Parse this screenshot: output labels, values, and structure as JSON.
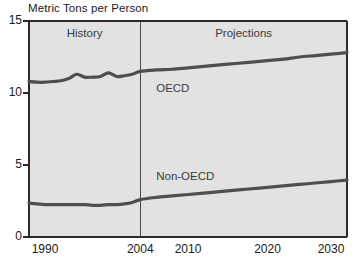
{
  "chart_data": {
    "type": "line",
    "title": "Metric Tons per Person",
    "xlabel": "",
    "ylabel": "Metric Tons per Person",
    "xlim": [
      1990,
      2030
    ],
    "ylim": [
      0,
      15
    ],
    "grid": false,
    "legend_position": "inline-annotation",
    "xticks": [
      "1990",
      "2004",
      "2010",
      "2020",
      "2030"
    ],
    "xtick_values": [
      1990,
      2004,
      2010,
      2020,
      2030
    ],
    "yticks": [
      "0",
      "5",
      "10",
      "15"
    ],
    "ytick_values": [
      0,
      5,
      10,
      15
    ],
    "divider_year": 2004,
    "annotations": [
      {
        "text": "History",
        "x": 1997,
        "y": 14.0
      },
      {
        "text": "Projections",
        "x": 2017,
        "y": 14.0
      }
    ],
    "x": [
      1990,
      1991,
      1992,
      1993,
      1994,
      1995,
      1996,
      1997,
      1998,
      1999,
      2000,
      2001,
      2002,
      2003,
      2004,
      2006,
      2008,
      2010,
      2012,
      2014,
      2016,
      2018,
      2020,
      2022,
      2024,
      2026,
      2028,
      2030
    ],
    "series": [
      {
        "name": "OECD",
        "label": "OECD",
        "label_x": 2006,
        "label_y": 10.2,
        "values": [
          10.8,
          10.75,
          10.75,
          10.8,
          10.85,
          11.0,
          11.3,
          11.1,
          11.1,
          11.15,
          11.4,
          11.15,
          11.2,
          11.3,
          11.5,
          11.6,
          11.65,
          11.75,
          11.85,
          11.95,
          12.05,
          12.15,
          12.25,
          12.35,
          12.5,
          12.6,
          12.7,
          12.8
        ]
      },
      {
        "name": "Non-OECD",
        "label": "Non-OECD",
        "label_x": 2006,
        "label_y": 4.1,
        "values": [
          2.35,
          2.3,
          2.25,
          2.25,
          2.25,
          2.25,
          2.25,
          2.25,
          2.2,
          2.2,
          2.25,
          2.25,
          2.3,
          2.4,
          2.6,
          2.75,
          2.85,
          2.95,
          3.05,
          3.15,
          3.25,
          3.35,
          3.45,
          3.55,
          3.65,
          3.75,
          3.85,
          3.95
        ]
      }
    ],
    "colors": {
      "plot_background": "#e2e2e2",
      "axis": "#2a2a2a",
      "line": "#4e4e4e",
      "divider": "#4a4a4a",
      "text": "#1b1b1b"
    }
  }
}
